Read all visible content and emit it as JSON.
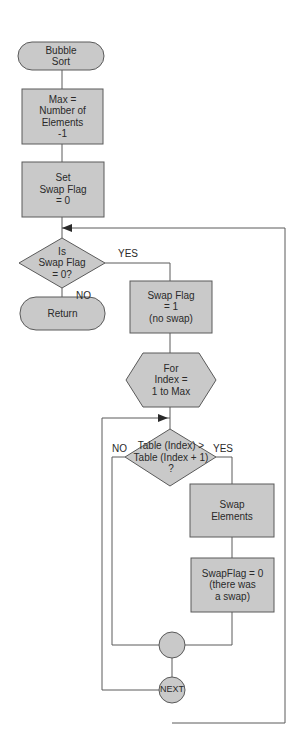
{
  "colors": {
    "fill": "#c9c9c9",
    "stroke": "#5a5a5a",
    "text": "#2a2a2a"
  },
  "nodes": {
    "start": "Bubble\nSort",
    "max": "Max =\nNumber of\nElements\n-1",
    "set_flag": "Set\nSwap Flag\n= 0",
    "is_flag_zero": "Is\nSwap Flag\n= 0?",
    "return": "Return",
    "flag_one": "Swap Flag\n= 1\n(no swap)",
    "for_loop": "For\nIndex =\n1 to Max",
    "compare": "Table (Index) >\nTable (Index + 1)\n?",
    "swap": "Swap\nElements",
    "flag_zero": "SwapFlag = 0\n(there was\na swap)",
    "connector": "",
    "next": "NEXT"
  },
  "edges": {
    "yes1": "YES",
    "no1": "NO",
    "no2": "NO",
    "yes2": "YES"
  }
}
